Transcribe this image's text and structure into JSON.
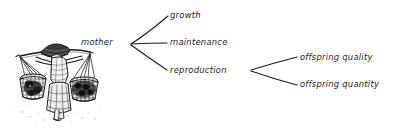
{
  "figure": {
    "background_color": "#ffffff",
    "ink_color": "#1c1c1c",
    "illustration": {
      "name": "woman-carrying-shoulder-yoke-with-two-baskets",
      "description": "Pen and ink sketch of a woman in a wide conical hat walking while carrying a shoulder pole with a woven basket hanging at each end"
    }
  },
  "diagram": {
    "root": {
      "id": "mother",
      "label": "mother"
    },
    "branches": [
      {
        "id": "growth",
        "label": "growth"
      },
      {
        "id": "maintenance",
        "label": "maintenance"
      },
      {
        "id": "reproduction",
        "label": "reproduction"
      }
    ],
    "sub_branches": [
      {
        "id": "offspring-quality",
        "label": "offspring quality",
        "parent": "reproduction"
      },
      {
        "id": "offspring-quantity",
        "label": "offspring quantity",
        "parent": "reproduction"
      }
    ]
  }
}
